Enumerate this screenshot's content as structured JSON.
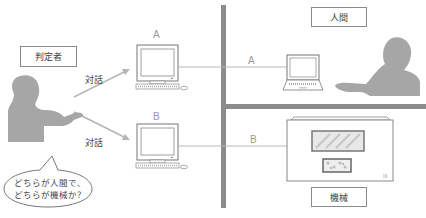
{
  "judge": {
    "label": "判定者"
  },
  "human": {
    "label": "人間"
  },
  "machine": {
    "label": "機械"
  },
  "dialogue": {
    "top_label": "対話",
    "bottom_label": "対話"
  },
  "terminals": {
    "a": {
      "label": "A",
      "line_label": "A"
    },
    "b": {
      "label": "B",
      "line_label": "B"
    }
  },
  "speech_bubble": {
    "line1": "どちらが人間で、",
    "line2": "どちらが機械か？"
  },
  "colors": {
    "wall": "#8c8c8c",
    "silhouette": "#a6a6a6",
    "line": "#b8b8b8",
    "arrow": "#b5b5b5"
  }
}
